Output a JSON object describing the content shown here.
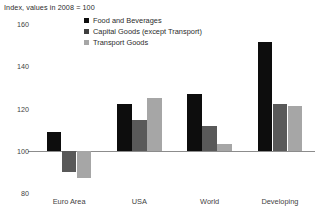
{
  "subtitle": "Index, values in 2008 = 100",
  "legend": {
    "position": "top-center-left",
    "items": [
      {
        "label": "Food and Beverages",
        "color": "#0d0d0d",
        "marker": "square-marker"
      },
      {
        "label": "Capital Goods (except Transport)",
        "color": "#3f3f3f",
        "marker": "square-marker"
      },
      {
        "label": "Transport Goods",
        "color": "#a6a6a6",
        "marker": "square-marker"
      }
    ]
  },
  "chart_data": {
    "type": "bar",
    "title": "",
    "subtitle": "Index, values in 2008 = 100",
    "xlabel": "",
    "ylabel": "",
    "categories": [
      "Euro Area",
      "USA",
      "World",
      "Developing"
    ],
    "series": [
      {
        "name": "Food and Beverages",
        "color": "#0d0d0d",
        "values": [
          109,
          122,
          127,
          151.5
        ]
      },
      {
        "name": "Capital Goods (except Transport)",
        "color": "#595959",
        "values": [
          90,
          114.5,
          111.5,
          122
        ]
      },
      {
        "name": "Transport Goods",
        "color": "#a6a6a6",
        "values": [
          87,
          125,
          103,
          121
        ]
      }
    ],
    "ylim": [
      80,
      160
    ],
    "yticks": [
      160,
      140,
      120,
      100,
      80
    ],
    "ytick_labels": [
      "160",
      "140",
      "120",
      "100",
      "80"
    ],
    "baseline": 100,
    "grid": false,
    "legend_position": "inside-top-center"
  }
}
